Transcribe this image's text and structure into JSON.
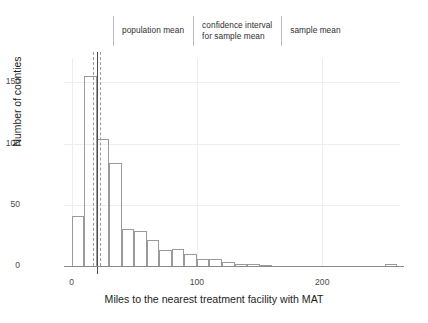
{
  "chart_data": {
    "type": "bar",
    "title": "",
    "subtitle": "",
    "xlabel": "Miles to the nearest treatment facility with MAT",
    "ylabel": "Number of counties",
    "xlim": [
      -6,
      262
    ],
    "ylim": [
      0,
      170
    ],
    "grid": true,
    "bin_width": 10,
    "xticks": [
      0,
      100,
      200
    ],
    "xtick_labels": [
      "0",
      "100",
      "200"
    ],
    "yticks": [
      0,
      50,
      100,
      150
    ],
    "ytick_labels": [
      "0",
      "50",
      "100",
      "150"
    ],
    "legend_position": "top",
    "bin_starts": [
      0,
      10,
      20,
      30,
      40,
      50,
      60,
      70,
      80,
      90,
      100,
      110,
      120,
      130,
      140,
      150,
      160,
      170,
      180,
      190,
      200,
      210,
      220,
      230,
      240,
      250
    ],
    "categories": [
      "0-10",
      "10-20",
      "20-30",
      "30-40",
      "40-50",
      "50-60",
      "60-70",
      "70-80",
      "80-90",
      "90-100",
      "100-110",
      "110-120",
      "120-130",
      "130-140",
      "140-150",
      "150-160",
      "160-170",
      "170-180",
      "180-190",
      "190-200",
      "200-210",
      "210-220",
      "220-230",
      "230-240",
      "240-250",
      "250-260"
    ],
    "values": [
      41,
      155,
      104,
      84,
      30,
      29,
      21,
      13,
      14,
      10,
      6,
      6,
      3,
      2,
      2,
      1,
      0,
      0,
      0,
      0,
      0,
      0,
      0,
      0,
      0,
      2
    ],
    "annotations": [
      {
        "name": "population-mean",
        "type": "vline",
        "x": 20.0,
        "style": "solid",
        "color": "#4c4c4c"
      },
      {
        "name": "confidence-interval-lower",
        "type": "vline",
        "x": 17.0,
        "style": "dashed",
        "color": "#9b9b9b"
      },
      {
        "name": "confidence-interval-upper",
        "type": "vline",
        "x": 23.0,
        "style": "dashed",
        "color": "#9b9b9b"
      },
      {
        "name": "sample-mean",
        "type": "vline",
        "x": 20.4,
        "style": "solid",
        "color": "#4c4c4c"
      }
    ]
  },
  "legend": {
    "entries": [
      {
        "label": "population mean",
        "lines": 1
      },
      {
        "label": "confidence interval\nfor sample mean",
        "lines": 2
      },
      {
        "label": "sample mean",
        "lines": 1
      }
    ]
  },
  "colors": {
    "bar_stroke": "#9a9a9a",
    "grid": "#eeeeee",
    "axis": "#8a8a8a",
    "mean_line": "#4c4c4c",
    "ci_line": "#9b9b9b",
    "text": "#1d1d1d"
  }
}
